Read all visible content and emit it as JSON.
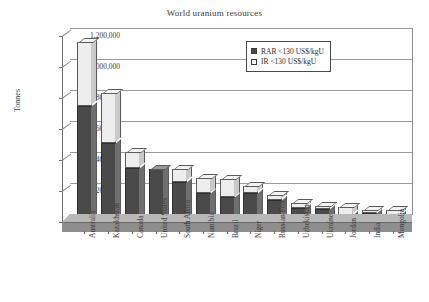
{
  "chart_data": {
    "type": "bar",
    "title": "World uranium resources",
    "xlabel": "",
    "ylabel": "Tonnes",
    "ylim": [
      0,
      1200000
    ],
    "ytick_labels": [
      "1,200,000",
      "1,000,000",
      "800,000",
      "600,000",
      "400,000",
      "200,000",
      "0"
    ],
    "ytick_values": [
      1200000,
      1000000,
      800000,
      600000,
      400000,
      200000,
      0
    ],
    "grid": true,
    "stacked": true,
    "legend_position": "top-right",
    "categories": [
      "Australia",
      "Kazakhstan",
      "Canada",
      "United States",
      "South Africa",
      "Namibia",
      "Brazil",
      "Niger",
      "Russian Fed.",
      "Uzbekistan",
      "Ukraine",
      "Jordan",
      "India",
      "Mongolia"
    ],
    "series": [
      {
        "name": "RAR <130 US$/kgU",
        "color": "#4a4a4a",
        "values": [
          750000,
          510000,
          350000,
          345000,
          255000,
          185000,
          160000,
          185000,
          145000,
          90000,
          85000,
          45000,
          55000,
          45000
        ]
      },
      {
        "name": "IR <130 US$/kgU",
        "color": "#ededed",
        "values": [
          410000,
          320000,
          100000,
          0,
          85000,
          100000,
          120000,
          45000,
          30000,
          35000,
          20000,
          50000,
          25000,
          30000
        ]
      }
    ],
    "totals": [
      1160000,
      830000,
      450000,
      345000,
      340000,
      285000,
      280000,
      230000,
      175000,
      125000,
      105000,
      95000,
      80000,
      75000
    ]
  },
  "legend": {
    "items": [
      {
        "label": "RAR <130 US$/kgU",
        "marker": "filled-square"
      },
      {
        "label": "IR <130 US$/kgU",
        "marker": "empty-square"
      }
    ]
  }
}
